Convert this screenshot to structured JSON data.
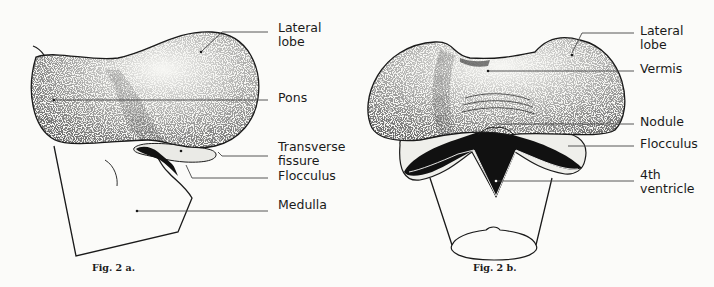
{
  "figures": [
    {
      "id": "fig-2a",
      "caption": "Fig. 2 a.",
      "view": "lateral view",
      "labels": [
        {
          "key": "lateral_lobe",
          "text": "Lateral\nlobe"
        },
        {
          "key": "pons",
          "text": "Pons"
        },
        {
          "key": "transverse_fissure",
          "text": "Transverse\nfissure"
        },
        {
          "key": "flocculus",
          "text": "Flocculus"
        },
        {
          "key": "medulla",
          "text": "Medulla"
        }
      ]
    },
    {
      "id": "fig-2b",
      "caption": "Fig. 2 b.",
      "view": "posterior view",
      "labels": [
        {
          "key": "lateral_lobe",
          "text": "Lateral\nlobe"
        },
        {
          "key": "vermis",
          "text": "Vermis"
        },
        {
          "key": "nodule",
          "text": "Nodule"
        },
        {
          "key": "flocculus",
          "text": "Flocculus"
        },
        {
          "key": "fourth_ventricle",
          "text": "4th\nventricle"
        }
      ]
    }
  ],
  "colors": {
    "background": "#fbfbf9",
    "ink": "#1a1a1a",
    "leader_line": "#444444",
    "stipple": "#2a2a2a",
    "cavity": "#111111"
  }
}
